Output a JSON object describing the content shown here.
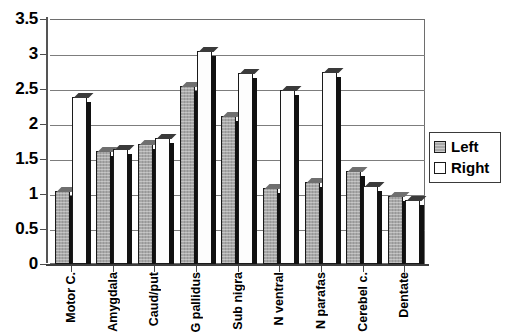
{
  "chart_data": {
    "type": "bar",
    "title": "",
    "xlabel": "",
    "ylabel": "",
    "ylim": [
      0,
      3.5
    ],
    "yticks": [
      "0",
      "0.5",
      "1",
      "1.5",
      "2",
      "2.5",
      "3",
      "3.5"
    ],
    "ytick_values": [
      0,
      0.5,
      1,
      1.5,
      2,
      2.5,
      3,
      3.5
    ],
    "grid": true,
    "legend_position": "right",
    "categories": [
      "Motor C.",
      "Amygdala",
      "Caud/put",
      "G pallidus",
      "Sub nigra",
      "N ventral",
      "N parafas",
      "Cerebel c.",
      "Dentate"
    ],
    "series": [
      {
        "name": "Left",
        "color": "#a8a8a8",
        "values": [
          1.05,
          1.62,
          1.72,
          2.55,
          2.12,
          1.08,
          1.17,
          1.33,
          0.97
        ]
      },
      {
        "name": "Right",
        "color": "#ffffff",
        "values": [
          2.38,
          1.65,
          1.8,
          3.05,
          2.73,
          2.48,
          2.75,
          1.12,
          0.92
        ]
      }
    ]
  },
  "legend": {
    "items": [
      {
        "label": "Left"
      },
      {
        "label": "Right"
      }
    ]
  }
}
